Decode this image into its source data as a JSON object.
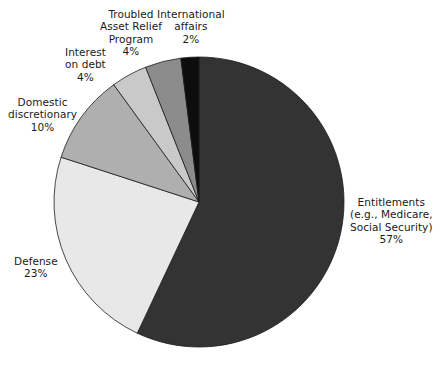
{
  "chart_data": {
    "type": "pie",
    "title": "",
    "subtitle": "",
    "xlabel": "",
    "ylabel": "",
    "legend_position": "callout-labels",
    "grid": false,
    "units": "percent",
    "total": 100,
    "categories": [
      "Entitlements (e.g., Medicare, Social Security)",
      "Defense",
      "Domestic discretionary",
      "Interest on debt",
      "Troubled Asset Relief Program",
      "International affairs"
    ],
    "values": [
      57,
      23,
      10,
      4,
      4,
      2
    ],
    "colors": [
      "#333333",
      "#E8E8E8",
      "#AFAFAF",
      "#C9C9C9",
      "#8C8C8C",
      "#0D0D0D"
    ],
    "slices": [
      {
        "name": "entitlements",
        "label_lines": [
          "Entitlements",
          "(e.g., Medicare,",
          "Social Security)"
        ],
        "value_label": "57%",
        "value": 57,
        "color": "#333333"
      },
      {
        "name": "defense",
        "label_lines": [
          "Defense"
        ],
        "value_label": "23%",
        "value": 23,
        "color": "#E8E8E8"
      },
      {
        "name": "domestic-discretionary",
        "label_lines": [
          "Domestic",
          "discretionary"
        ],
        "value_label": "10%",
        "value": 10,
        "color": "#AFAFAF"
      },
      {
        "name": "interest-on-debt",
        "label_lines": [
          "Interest",
          "on debt"
        ],
        "value_label": "4%",
        "value": 4,
        "color": "#C9C9C9"
      },
      {
        "name": "troubled-asset-relief-program",
        "label_lines": [
          "Troubled",
          "Asset Relief",
          "Program"
        ],
        "value_label": "4%",
        "value": 4,
        "color": "#8C8C8C"
      },
      {
        "name": "international-affairs",
        "label_lines": [
          "International",
          "affairs"
        ],
        "value_label": "2%",
        "value": 2,
        "color": "#0D0D0D"
      }
    ]
  },
  "geometry": {
    "center_x": 199,
    "center_y": 202,
    "radius": 145,
    "start_angle_deg": 0,
    "direction": "clockwise"
  },
  "labels": {
    "entitlements": {
      "lines": [
        "Entitlements",
        "(e.g., Medicare,",
        "Social Security)",
        "57%"
      ],
      "align": "center",
      "left": 350,
      "top": 196
    },
    "defense": {
      "lines": [
        "Defense",
        "23%"
      ],
      "align": "center",
      "left": 14,
      "top": 255
    },
    "domestic_discretionary": {
      "lines": [
        "Domestic",
        "discretionary",
        "10%"
      ],
      "align": "center",
      "left": 8,
      "top": 96
    },
    "interest_on_debt": {
      "lines": [
        "Interest",
        "on debt",
        "4%"
      ],
      "align": "center",
      "left": 65,
      "top": 46
    },
    "troubled_asset_relief_program": {
      "lines": [
        "Troubled",
        "Asset Relief",
        "Program",
        "4%"
      ],
      "align": "center",
      "left": 100,
      "top": 8
    },
    "international_affairs": {
      "lines": [
        "International",
        "affairs",
        "2%"
      ],
      "align": "center",
      "left": 157,
      "top": 8
    }
  },
  "style": {
    "background": "#ffffff",
    "text_color": "#1a1a1a",
    "slice_border": "#1c1c1c"
  }
}
